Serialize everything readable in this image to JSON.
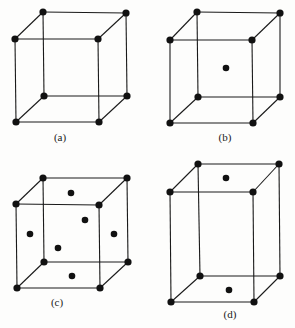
{
  "figure": {
    "panels": [
      {
        "label": "(a)",
        "type": "simple-cubic",
        "corners": [
          [
            43,
            12
          ],
          [
            126,
            13
          ],
          [
            15,
            39
          ],
          [
            98,
            39
          ],
          [
            44,
            96
          ],
          [
            127,
            96
          ],
          [
            16,
            122
          ],
          [
            99,
            122
          ]
        ],
        "extra_atoms": [],
        "label_pos": [
          60,
          141
        ]
      },
      {
        "label": "(b)",
        "type": "body-centered-cubic",
        "corners": [
          [
            197,
            12
          ],
          [
            280,
            13
          ],
          [
            170,
            40
          ],
          [
            252,
            40
          ],
          [
            198,
            97
          ],
          [
            280,
            97
          ],
          [
            170,
            123
          ],
          [
            253,
            123
          ]
        ],
        "extra_atoms": [
          [
            226,
            68
          ]
        ],
        "label_pos": [
          225,
          141
        ]
      },
      {
        "label": "(c)",
        "type": "face-centered-cubic",
        "corners": [
          [
            43,
            178
          ],
          [
            127,
            178
          ],
          [
            16,
            204
          ],
          [
            99,
            205
          ],
          [
            44,
            262
          ],
          [
            128,
            262
          ],
          [
            17,
            288
          ],
          [
            100,
            288
          ]
        ],
        "extra_atoms": [
          [
            71,
            193
          ],
          [
            85,
            220
          ],
          [
            30,
            234
          ],
          [
            114,
            234
          ],
          [
            58,
            248
          ],
          [
            72,
            276
          ]
        ],
        "label_pos": [
          57,
          306
        ]
      },
      {
        "label": "(d)",
        "type": "base-centered-tetragonal",
        "corners": [
          [
            198,
            164
          ],
          [
            279,
            164
          ],
          [
            170,
            192
          ],
          [
            253,
            192
          ],
          [
            200,
            276
          ],
          [
            280,
            276
          ],
          [
            171,
            302
          ],
          [
            254,
            302
          ]
        ],
        "extra_atoms": [
          [
            226,
            178
          ],
          [
            229,
            290
          ]
        ],
        "label_pos": [
          230,
          318
        ]
      }
    ]
  },
  "colors": {
    "line": "#1a1a1a",
    "atom": "#111111",
    "background": "#fdfdfc"
  }
}
